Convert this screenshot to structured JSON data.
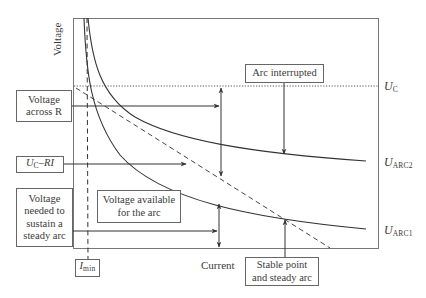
{
  "diagram": {
    "axes": {
      "y_label": "Voltage",
      "x_label": "Current"
    },
    "curve_labels": {
      "uc_main": "U",
      "uc_sub": "C",
      "arc2_main": "U",
      "arc2_sub": "ARC2",
      "arc1_main": "U",
      "arc1_sub": "ARC1"
    },
    "imin": {
      "main": "I",
      "sub": "min"
    },
    "boxes": {
      "voltage_across_r": [
        "Voltage",
        "across R"
      ],
      "uc_minus_ri": {
        "u": "U",
        "sub": "C",
        "rest": "–RI"
      },
      "voltage_needed": [
        "Voltage",
        "needed to",
        "sustain a",
        "steady arc"
      ],
      "voltage_available": [
        "Voltage available",
        "for the arc"
      ],
      "arc_interrupted": "Arc interrupted",
      "stable_point": [
        "Stable point",
        "and steady arc"
      ]
    },
    "colors": {
      "line": "#3a3a3a",
      "frame": "#777777",
      "background": "#ffffff"
    }
  }
}
